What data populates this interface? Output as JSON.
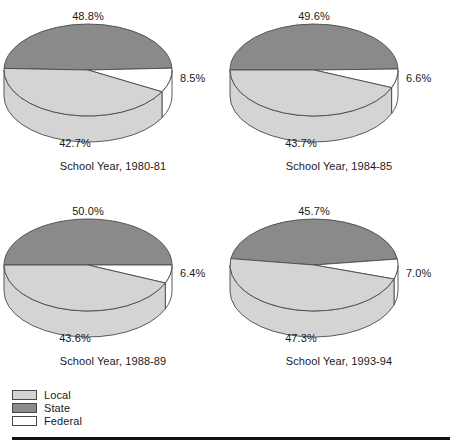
{
  "chart_data": {
    "type": "pie",
    "title": "",
    "subtitle": "",
    "xlabel": "",
    "ylabel": "",
    "legend_position": "bottom-left",
    "grid": false,
    "categories": [
      "Local",
      "State",
      "Federal"
    ],
    "colors": {
      "Local": "#d4d4d4",
      "State": "#8a8a8a",
      "Federal": "#ffffff",
      "outline": "#4a4a4a",
      "text": "#1a1a1a",
      "rule": "#111111"
    },
    "charts": [
      {
        "caption": "School Year, 1980-81",
        "slices": [
          {
            "name": "State",
            "value": 48.8,
            "label": "48.8%"
          },
          {
            "name": "Federal",
            "value": 8.5,
            "label": "8.5%"
          },
          {
            "name": "Local",
            "value": 42.7,
            "label": "42.7%"
          }
        ],
        "start_angle_deg": 182
      },
      {
        "caption": "School Year, 1984-85",
        "slices": [
          {
            "name": "State",
            "value": 49.6,
            "label": "49.6%"
          },
          {
            "name": "Federal",
            "value": 6.6,
            "label": "6.6%"
          },
          {
            "name": "Local",
            "value": 43.7,
            "label": "43.7%"
          }
        ],
        "start_angle_deg": 180
      },
      {
        "caption": "School Year, 1988-89",
        "slices": [
          {
            "name": "State",
            "value": 50.0,
            "label": "50.0%"
          },
          {
            "name": "Federal",
            "value": 6.4,
            "label": "6.4%"
          },
          {
            "name": "Local",
            "value": 43.6,
            "label": "43.6%"
          }
        ],
        "start_angle_deg": 180
      },
      {
        "caption": "School Year, 1993-94",
        "slices": [
          {
            "name": "State",
            "value": 45.7,
            "label": "45.7%"
          },
          {
            "name": "Federal",
            "value": 7.0,
            "label": "7.0%"
          },
          {
            "name": "Local",
            "value": 47.3,
            "label": "47.3%"
          }
        ],
        "start_angle_deg": 188
      }
    ]
  },
  "legend": {
    "items": [
      {
        "label": "Local",
        "color": "#d4d4d4"
      },
      {
        "label": "State",
        "color": "#8a8a8a"
      },
      {
        "label": "Federal",
        "color": "#ffffff"
      }
    ]
  }
}
